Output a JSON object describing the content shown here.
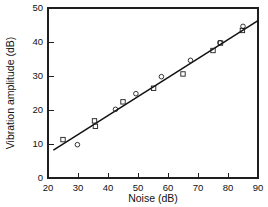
{
  "chart_data": {
    "type": "scatter",
    "title": "",
    "xlabel": "Noise (dB)",
    "ylabel": "Vibration amplitude (dB)",
    "xlim": [
      20,
      90
    ],
    "ylim": [
      0,
      50
    ],
    "xticks": [
      20,
      30,
      40,
      50,
      60,
      70,
      80,
      90
    ],
    "yticks": [
      0,
      10,
      20,
      30,
      40,
      50
    ],
    "grid": false,
    "legend": "none",
    "series": [
      {
        "name": "square-markers",
        "marker": "square",
        "points": [
          {
            "x": 25.0,
            "y": 11.3
          },
          {
            "x": 35.5,
            "y": 16.8
          },
          {
            "x": 35.8,
            "y": 15.2
          },
          {
            "x": 45.0,
            "y": 22.4
          },
          {
            "x": 55.2,
            "y": 26.4
          },
          {
            "x": 65.0,
            "y": 30.6
          },
          {
            "x": 75.0,
            "y": 37.5
          },
          {
            "x": 77.5,
            "y": 39.7
          },
          {
            "x": 84.8,
            "y": 43.4
          }
        ]
      },
      {
        "name": "circle-markers",
        "marker": "circle",
        "points": [
          {
            "x": 29.8,
            "y": 9.8
          },
          {
            "x": 42.5,
            "y": 20.2
          },
          {
            "x": 49.3,
            "y": 24.8
          },
          {
            "x": 57.8,
            "y": 29.8
          },
          {
            "x": 67.5,
            "y": 34.6
          },
          {
            "x": 77.3,
            "y": 39.8
          },
          {
            "x": 85.0,
            "y": 44.6
          }
        ]
      }
    ],
    "fit_line": {
      "name": "regression-line",
      "x_start": 21.8,
      "y_start": 8.2,
      "x_end": 90.0,
      "y_end": 46.3
    }
  },
  "axes": {
    "x_tick_labels": [
      "20",
      "30",
      "40",
      "50",
      "60",
      "70",
      "80",
      "90"
    ],
    "y_tick_labels": [
      "0",
      "10",
      "20",
      "30",
      "40",
      "50"
    ],
    "x_axis_title": "Noise (dB)",
    "y_axis_title": "Vibration amplitude (dB)"
  },
  "colors": {
    "axis": "#1f1f1f",
    "marker": "#1f1f1f",
    "line": "#111111",
    "background": "#ffffff"
  }
}
